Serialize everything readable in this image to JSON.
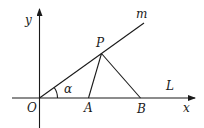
{
  "diagram": {
    "labels": {
      "y_axis": "y",
      "x_axis": "x",
      "ray": "m",
      "point_P": "P",
      "origin": "O",
      "angle": "α",
      "point_A": "A",
      "point_B": "B",
      "line": "L"
    },
    "segments": [
      "OP (on ray m)",
      "PA",
      "PB",
      "OB (on x-axis)"
    ],
    "color": "#1a1a1a"
  }
}
